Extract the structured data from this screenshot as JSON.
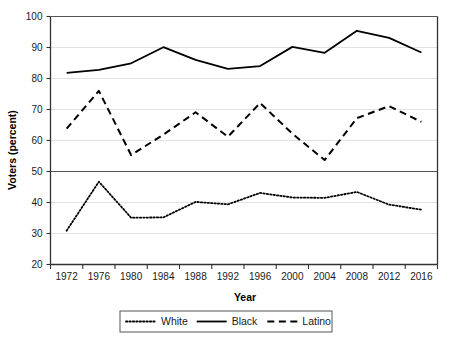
{
  "chart_data": {
    "type": "line",
    "title": "",
    "xlabel": "Year",
    "ylabel": "Voters (percent)",
    "x": [
      1972,
      1976,
      1980,
      1984,
      1988,
      1992,
      1996,
      2000,
      2004,
      2008,
      2012,
      2016
    ],
    "categories": [
      "1972",
      "1976",
      "1980",
      "1984",
      "1988",
      "1992",
      "1996",
      "2000",
      "2004",
      "2008",
      "2012",
      "2016"
    ],
    "xlim": [
      1972,
      2016
    ],
    "ylim": [
      20,
      100
    ],
    "yticks": [
      20,
      30,
      40,
      50,
      60,
      70,
      80,
      90,
      100
    ],
    "ytick_labels": [
      "20",
      "30",
      "40",
      "50",
      "60",
      "70",
      "80",
      "90",
      "100"
    ],
    "grid": true,
    "grid_axis": "y",
    "legend_position": "bottom",
    "series": [
      {
        "name": "White",
        "style": "dotted",
        "color": "#000000",
        "values": [
          30.9,
          46.7,
          35.1,
          35.2,
          40.2,
          39.4,
          43.1,
          41.6,
          41.5,
          43.4,
          39.3,
          37.7
        ]
      },
      {
        "name": "Black",
        "style": "solid",
        "color": "#000000",
        "values": [
          81.8,
          82.8,
          84.9,
          90.1,
          86.0,
          83.1,
          84.0,
          90.2,
          88.3,
          95.4,
          93.1,
          88.4
        ]
      },
      {
        "name": "Latino",
        "style": "dashed",
        "color": "#000000",
        "values": [
          63.8,
          76.0,
          55.3,
          61.9,
          69.1,
          61.2,
          72.1,
          62.2,
          53.7,
          67.2,
          71.1,
          66.0
        ]
      }
    ]
  },
  "legend": {
    "items": [
      {
        "label": "White",
        "style": "dotted"
      },
      {
        "label": "Black",
        "style": "solid"
      },
      {
        "label": "Latino",
        "style": "dashed"
      }
    ]
  },
  "axes": {
    "x_title": "Year",
    "y_title": "Voters (percent)"
  }
}
